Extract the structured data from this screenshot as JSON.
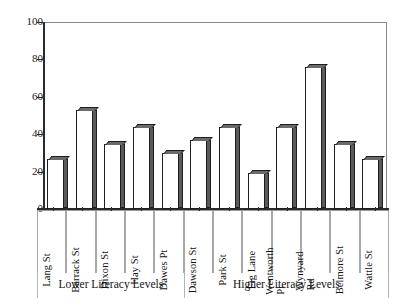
{
  "chart_data": {
    "type": "bar",
    "title": "",
    "subtitle": "",
    "xlabel": "",
    "ylabel": "",
    "ylim": [
      0,
      100
    ],
    "yticks": [
      0,
      20,
      40,
      60,
      80,
      100
    ],
    "grid": false,
    "legend": null,
    "categories": [
      "Lang St",
      "Barrack St",
      "Dixon St",
      "Hay St",
      "Dawes Pt",
      "Dawson St",
      "Park St",
      "Fig Lane",
      "Wentworth Pl",
      "Wynyard Rd",
      "Belmore St",
      "Wattle St"
    ],
    "category_lines": [
      [
        "Lang St"
      ],
      [
        "Barrack St"
      ],
      [
        "Dixon St"
      ],
      [
        "Hay St"
      ],
      [
        "Dawes Pt"
      ],
      [
        "Dawson St"
      ],
      [
        "Park St"
      ],
      [
        "Fig Lane"
      ],
      [
        "Wentworth",
        "Pl"
      ],
      [
        "Wynyard",
        "Rd"
      ],
      [
        "Belmore St"
      ],
      [
        "Wattle St"
      ]
    ],
    "values": [
      27,
      53,
      35,
      44,
      30,
      37,
      44,
      19,
      44,
      76,
      35,
      27
    ],
    "groups": [
      {
        "label": "Lower Literacy Levels",
        "start": 0,
        "end": 4
      },
      {
        "label": "Higher Literacy Levels",
        "start": 5,
        "end": 11
      }
    ],
    "bar_style": {
      "fill": "#ffffff",
      "outline": "#1e1e1e",
      "shadow": "#5a5a5a"
    }
  }
}
